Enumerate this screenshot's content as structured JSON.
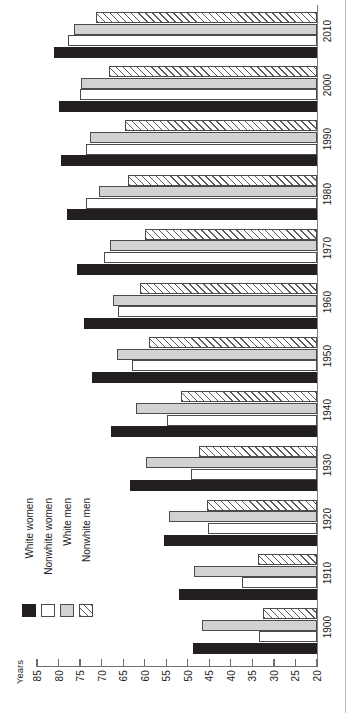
{
  "chart_data": {
    "type": "bar",
    "orientation": "horizontal-rotated",
    "title": "",
    "xlabel": "Years",
    "ylabel": "",
    "categories": [
      "1900",
      "1910",
      "1920",
      "1930",
      "1940",
      "1950",
      "1960",
      "1970",
      "1980",
      "1990",
      "2000",
      "2010"
    ],
    "xlim": [
      20,
      85
    ],
    "x_axis_reversed": true,
    "xticks": [
      85,
      80,
      75,
      70,
      65,
      60,
      55,
      50,
      45,
      40,
      35,
      30,
      25,
      20
    ],
    "xtick_labels": [
      "85",
      "80",
      "75",
      "70",
      "65",
      "60",
      "55",
      "50",
      "45",
      "40",
      "35",
      "30",
      "25",
      "20"
    ],
    "grid": false,
    "legend_position": "bottom-left",
    "series": [
      {
        "name": "White women",
        "key": "white_women",
        "pattern": "solid-black",
        "color": "#231f20",
        "values": [
          48.7,
          52.0,
          55.6,
          63.5,
          67.9,
          72.2,
          74.1,
          75.6,
          78.1,
          79.4,
          79.9,
          81.1
        ]
      },
      {
        "name": "Nonwhite women",
        "key": "nonwhite_women",
        "pattern": "white-fill",
        "color": "#ffffff",
        "values": [
          33.5,
          37.5,
          45.2,
          49.2,
          54.9,
          62.9,
          66.3,
          69.4,
          73.6,
          73.6,
          75.1,
          77.8
        ]
      },
      {
        "name": "White men",
        "key": "white_men",
        "pattern": "gray-fill",
        "color": "#d2d2d2",
        "values": [
          46.6,
          48.6,
          54.4,
          59.7,
          62.1,
          66.5,
          67.4,
          68.0,
          70.7,
          72.7,
          74.8,
          76.4
        ]
      },
      {
        "name": "Nonwhite men",
        "key": "nonwhite_men",
        "pattern": "diagonal-hatch",
        "color": "#ffffff",
        "values": [
          32.5,
          33.8,
          45.5,
          47.3,
          51.5,
          59.1,
          61.1,
          60.0,
          63.8,
          64.5,
          68.2,
          71.4
        ]
      }
    ]
  },
  "axis": {
    "value_axis_title": "Years"
  },
  "legend": {
    "items": [
      {
        "label": "White women",
        "key": "white_women"
      },
      {
        "label": "Nonwhite women",
        "key": "nonwhite_women"
      },
      {
        "label": "White men",
        "key": "white_men"
      },
      {
        "label": "Nonwhite men",
        "key": "nonwhite_men"
      }
    ]
  }
}
